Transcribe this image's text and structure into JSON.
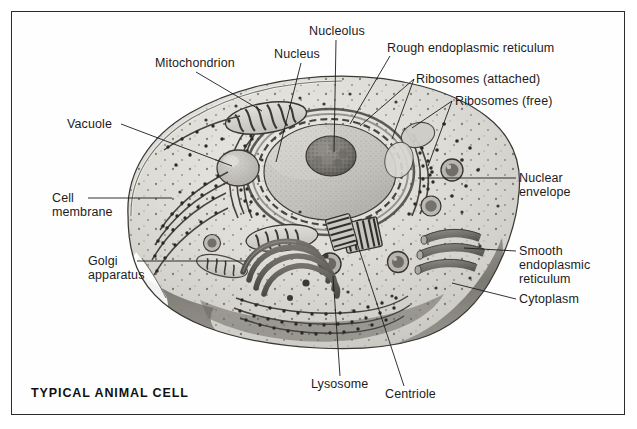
{
  "figure": {
    "caption": "TYPICAL ANIMAL CELL",
    "type": "labeled biological diagram",
    "style": "grayscale pencil / halftone textbook art",
    "border_color": "#2b2b2b",
    "background_color": "#ffffff",
    "ink_color": "#1c1c1c"
  },
  "labels": {
    "mitochondrion": "Mitochondrion",
    "vacuole": "Vacuole",
    "cell_membrane_line1": "Cell",
    "cell_membrane_line2": "membrane",
    "golgi_line1": "Golgi",
    "golgi_line2": "apparatus",
    "nucleus": "Nucleus",
    "nucleolus": "Nucleolus",
    "rough_er": "Rough endoplasmic reticulum",
    "ribosomes_attached": "Ribosomes (attached)",
    "ribosomes_free": "Ribosomes (free)",
    "nuclear_envelope_line1": "Nuclear",
    "nuclear_envelope_line2": "envelope",
    "smooth_er_line1": "Smooth",
    "smooth_er_line2": "endoplasmic",
    "smooth_er_line3": "reticulum",
    "cytoplasm": "Cytoplasm",
    "lysosome": "Lysosome",
    "centriole": "Centriole"
  },
  "parts_list": [
    "Mitochondrion",
    "Vacuole",
    "Cell membrane",
    "Golgi apparatus",
    "Nucleus",
    "Nucleolus",
    "Rough endoplasmic reticulum",
    "Ribosomes (attached)",
    "Ribosomes (free)",
    "Nuclear envelope",
    "Smooth endoplasmic reticulum",
    "Cytoplasm",
    "Lysosome",
    "Centriole"
  ]
}
